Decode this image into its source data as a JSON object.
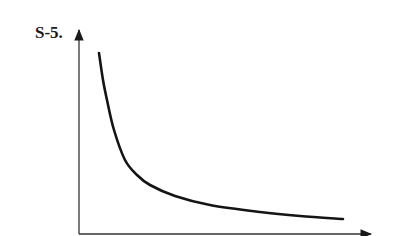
{
  "figure": {
    "label": "S-5."
  },
  "chart_data": {
    "type": "line",
    "title": "S-5.",
    "xlabel": "",
    "ylabel": "",
    "grid": false,
    "legend": null,
    "series": [
      {
        "name": "curve",
        "points_px": [
          [
            99,
            53
          ],
          [
            103,
            80
          ],
          [
            107,
            100
          ],
          [
            114,
            130
          ],
          [
            125,
            160
          ],
          [
            137,
            175
          ],
          [
            150,
            185
          ],
          [
            175,
            196
          ],
          [
            210,
            205
          ],
          [
            260,
            212
          ],
          [
            300,
            216
          ],
          [
            343,
            219
          ]
        ]
      }
    ]
  }
}
